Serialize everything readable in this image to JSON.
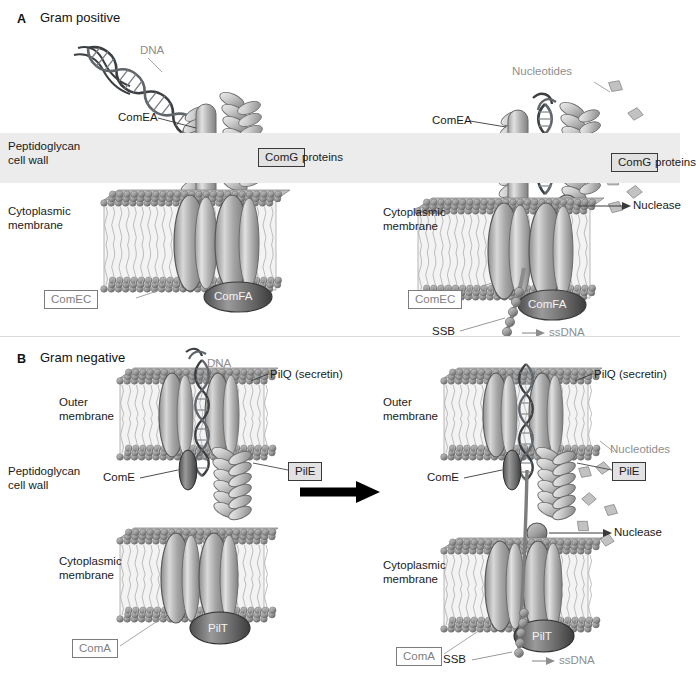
{
  "figure": {
    "title_implicit": "DNA uptake machinery in Gram-positive and Gram-negative bacteria",
    "colors": {
      "background": "#ffffff",
      "text_dark": "#1a1a1a",
      "text_grey": "#8e8e8e",
      "peptidoglycan_band": "#ececec",
      "protein_mid": "#9a9a9a",
      "protein_dark": "#6a6a6a",
      "arrow": "#000000",
      "box_border_grey": "#7c7c7c",
      "box_border_dark": "#3a3a3a",
      "box_fill_grey": "#e2e2e2"
    }
  },
  "panels": {
    "a": {
      "letter": "A",
      "title": "Gram positive",
      "left": {
        "labels": {
          "dna": "DNA",
          "com_ea": "ComEA",
          "peptidoglycan": "Peptidoglycan\ncell wall",
          "peptidoglycan_line1": "Peptidoglycan",
          "peptidoglycan_line2": "cell wall",
          "com_g": "ComG",
          "com_g_suffix": "proteins",
          "cytoplasmic": "Cytoplasmic\nmembrane",
          "cytoplasmic_line1": "Cytoplasmic",
          "cytoplasmic_line2": "membrane",
          "com_ec": "ComEC",
          "com_fa": "ComFA"
        }
      },
      "right": {
        "labels": {
          "nucleotides": "Nucleotides",
          "com_ea": "ComEA",
          "com_g": "ComG",
          "com_g_suffix": "proteins",
          "nuclease": "Nuclease",
          "cytoplasmic_line1": "Cytoplasmic",
          "cytoplasmic_line2": "membrane",
          "com_ec": "ComEC",
          "com_fa": "ComFA",
          "ssb": "SSB",
          "ssdna": "ssDNA"
        }
      }
    },
    "b": {
      "letter": "B",
      "title": "Gram negative",
      "left": {
        "labels": {
          "dna": "DNA",
          "pil_q": "PilQ (secretin)",
          "outer_line1": "Outer",
          "outer_line2": "membrane",
          "peptidoglycan_line1": "Peptidoglycan",
          "peptidoglycan_line2": "cell wall",
          "com_e": "ComE",
          "pil_e": "PilE",
          "cytoplasmic_line1": "Cytoplasmic",
          "cytoplasmic_line2": "membrane",
          "com_a": "ComA",
          "pil_t": "PilT"
        }
      },
      "right": {
        "labels": {
          "pil_q": "PilQ (secretin)",
          "outer_line1": "Outer",
          "outer_line2": "membrane",
          "nucleotides": "Nucleotides",
          "com_e": "ComE",
          "pil_e": "PilE",
          "nuclease": "Nuclease",
          "cytoplasmic_line1": "Cytoplasmic",
          "cytoplasmic_line2": "membrane",
          "com_a": "ComA",
          "pil_t": "PilT",
          "ssb": "SSB",
          "ssdna": "ssDNA"
        }
      }
    }
  },
  "icons": {
    "transition_arrow": "right-arrow-icon",
    "leader_line": "leader-line-icon",
    "dna_helix": "dna-helix-icon",
    "membrane": "lipid-bilayer-icon",
    "nucleotide_fragment": "nucleotide-fragment-icon",
    "nuclease_sphere": "nuclease-sphere-icon",
    "ssdna_strand": "ssdna-strand-icon",
    "ssb_beads": "ssb-bead-icon",
    "pilus_fiber": "pilus-fiber-icon",
    "channel_protein": "channel-protein-icon"
  }
}
